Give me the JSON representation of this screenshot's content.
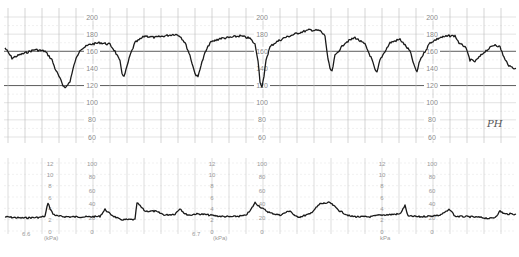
{
  "chart_data": [
    {
      "type": "line",
      "title": "Fetal Heart Rate (CTG)",
      "ylabel": "FHR (bpm)",
      "ylim": [
        60,
        200
      ],
      "y_ticks": [
        200,
        180,
        160,
        140,
        120,
        100,
        80,
        60
      ],
      "emphasized_gridlines": [
        160,
        120
      ],
      "grid": true,
      "scale_label_repeats_x": [
        92,
        262,
        432
      ],
      "annotation": "PH",
      "series": [
        {
          "name": "FHR",
          "description": "Baseline ~160-180 bpm with repeated decelerations",
          "points_x_px": [
            5,
            12,
            20,
            35,
            45,
            52,
            55,
            60,
            63,
            66,
            70,
            75,
            80,
            90,
            100,
            110,
            115,
            120,
            122,
            124,
            126,
            130,
            135,
            145,
            155,
            165,
            175,
            180,
            185,
            190,
            194,
            196,
            198,
            200,
            205,
            210,
            220,
            230,
            240,
            250,
            255,
            258,
            260,
            262,
            264,
            266,
            270,
            275,
            285,
            300,
            310,
            320,
            325,
            328,
            330,
            332,
            335,
            345,
            355,
            365,
            372,
            375,
            377,
            380,
            390,
            400,
            410,
            415,
            417,
            420,
            430,
            440,
            450,
            455,
            460,
            465,
            470,
            475,
            485,
            495,
            500,
            505,
            510,
            516
          ],
          "values_bpm": [
            164,
            152,
            156,
            162,
            160,
            150,
            140,
            128,
            120,
            118,
            125,
            148,
            162,
            168,
            170,
            168,
            160,
            148,
            135,
            130,
            138,
            155,
            170,
            178,
            176,
            178,
            180,
            178,
            170,
            155,
            138,
            132,
            130,
            140,
            158,
            170,
            175,
            176,
            178,
            175,
            168,
            150,
            125,
            118,
            130,
            150,
            165,
            170,
            176,
            182,
            185,
            184,
            178,
            150,
            140,
            136,
            155,
            170,
            176,
            168,
            150,
            138,
            135,
            150,
            170,
            174,
            160,
            140,
            136,
            150,
            170,
            176,
            178,
            178,
            168,
            166,
            150,
            148,
            160,
            168,
            165,
            150,
            142,
            140
          ]
        }
      ]
    },
    {
      "type": "line",
      "title": "Uterine Activity (Toco)",
      "ylabel": "Pressure",
      "units": [
        "kPa",
        "mmHg"
      ],
      "ylim_kpa": [
        0,
        12
      ],
      "ylim_mmhg": [
        0,
        100
      ],
      "y_ticks_kpa": [
        12,
        10,
        8,
        6,
        4,
        2,
        0
      ],
      "y_ticks_mmhg": [
        100,
        80,
        60,
        40,
        20,
        0
      ],
      "grid": true,
      "footer_labels": [
        "6.6",
        "0 (kPa)",
        "0",
        "6.7",
        "0 (kPa)",
        "0",
        "0 (kPa)",
        "0"
      ],
      "series": [
        {
          "name": "Toco",
          "description": "Baseline ~2-3 kPa with small contractions",
          "points_x_px": [
            5,
            20,
            40,
            45,
            48,
            50,
            53,
            58,
            70,
            90,
            100,
            105,
            110,
            120,
            135,
            137,
            145,
            155,
            165,
            175,
            180,
            185,
            190,
            195,
            200,
            210,
            220,
            230,
            245,
            250,
            255,
            262,
            270,
            280,
            290,
            295,
            300,
            310,
            320,
            330,
            340,
            350,
            360,
            370,
            380,
            400,
            405,
            408,
            412,
            420,
            440,
            450,
            455,
            470,
            480,
            490,
            495,
            500,
            505,
            510,
            516
          ],
          "values_kpa": [
            2.5,
            2.3,
            2.4,
            2.6,
            5.0,
            4.0,
            3.0,
            2.6,
            2.5,
            2.5,
            2.6,
            3.8,
            3.0,
            2.0,
            2.0,
            5.0,
            3.5,
            3.5,
            2.8,
            3.0,
            4.0,
            3.0,
            2.8,
            3.0,
            3.0,
            2.8,
            2.6,
            2.5,
            2.7,
            3.5,
            5.0,
            4.0,
            3.2,
            2.8,
            3.6,
            2.6,
            2.5,
            3.0,
            4.8,
            5.0,
            3.5,
            2.6,
            2.5,
            2.5,
            2.8,
            3.0,
            4.5,
            2.6,
            2.6,
            2.5,
            2.8,
            3.8,
            2.6,
            2.5,
            2.4,
            2.2,
            2.4,
            3.5,
            3.0,
            3.0,
            3.0
          ]
        }
      ]
    }
  ],
  "fhr_panel": {
    "tick_labels": [
      "200",
      "180",
      "160",
      "140",
      "120",
      "100",
      "80",
      "60"
    ],
    "annotation": "PH"
  },
  "toco_panel": {
    "kpa_labels": [
      "12",
      "10",
      "8",
      "6",
      "4",
      "2",
      "0"
    ],
    "mmhg_labels": [
      "100",
      "80",
      "60",
      "40",
      "20",
      "0"
    ],
    "footer": {
      "speed_1": "6.6",
      "unit_1": "(kPa)",
      "speed_2": "6.7",
      "unit_2": "(kPa)",
      "unit_3": "kPa"
    }
  }
}
